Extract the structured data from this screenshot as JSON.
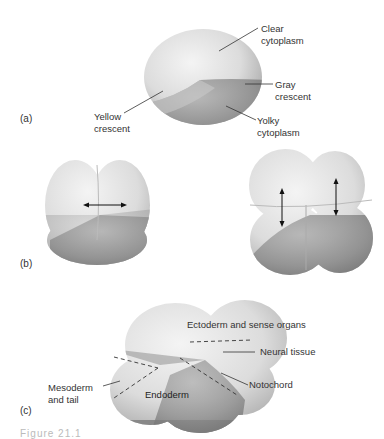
{
  "panels": {
    "a": {
      "marker": "(a)",
      "labels": {
        "clear_cytoplasm": "Clear\ncytoplasm",
        "gray_crescent": "Gray\ncrescent",
        "yellow_crescent": "Yellow\ncrescent",
        "yolky_cytoplasm": "Yolky\ncytoplasm"
      }
    },
    "b": {
      "marker": "(b)"
    },
    "c": {
      "marker": "(c)",
      "labels": {
        "ectoderm": "Ectoderm and sense organs",
        "neural_tissue": "Neural tissue",
        "notochord": "Notochord",
        "mesoderm": "Mesoderm\nand tail",
        "endoderm": "Endoderm"
      }
    }
  },
  "caption": "Figure 21.1"
}
